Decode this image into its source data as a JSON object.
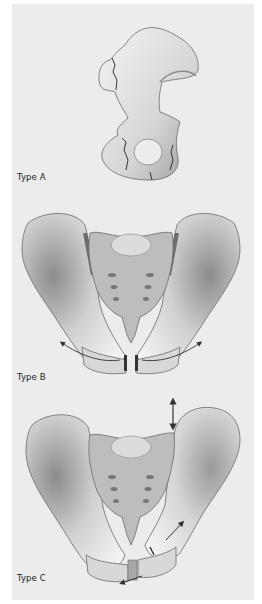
{
  "figure": {
    "panels": [
      {
        "id": "type-a",
        "label": "Type A",
        "description": "Single hemipelvis (innominate bone) with stable fracture lines"
      },
      {
        "id": "type-b",
        "label": "Type B",
        "description": "Full pelvis, open-book injury with rotational arrows at pubic symphysis"
      },
      {
        "id": "type-c",
        "label": "Type C",
        "description": "Full pelvis, vertical instability with vertical double arrow and displacement arrows"
      }
    ],
    "colors": {
      "background": "#ececec",
      "margin": "#ffffff",
      "bone_light": "#f2f2f2",
      "bone_shade": "#8a8a8a",
      "sacrum": "#bdbdbd",
      "fracture_line": "#222222",
      "arrow": "#333333",
      "label_text": "#222222"
    }
  }
}
